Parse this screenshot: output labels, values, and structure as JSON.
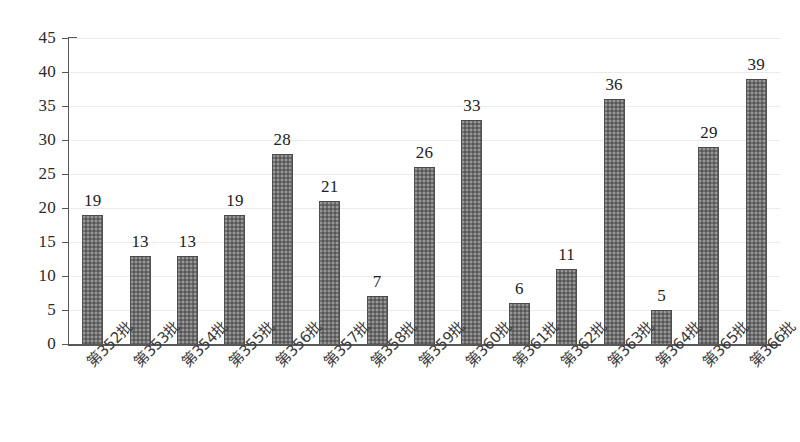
{
  "chart_data": {
    "type": "bar",
    "title": "",
    "subtitle": "",
    "xlabel": "",
    "ylabel": "",
    "ylim": [
      0,
      45
    ],
    "ytick_step": 5,
    "yticks": [
      45,
      40,
      35,
      30,
      25,
      20,
      15,
      10,
      5,
      0
    ],
    "grid": true,
    "legend": "none",
    "orientation": "vertical",
    "show_value_labels": true,
    "xtick_rotation": -45,
    "categories": [
      "第352批",
      "第353批",
      "第354批",
      "第355批",
      "第356批",
      "第357批",
      "第358批",
      "第359批",
      "第360批",
      "第361批",
      "第362批",
      "第363批",
      "第364批",
      "第365批",
      "第366批"
    ],
    "values": [
      19,
      13,
      13,
      19,
      28,
      21,
      7,
      26,
      33,
      6,
      11,
      36,
      5,
      29,
      39
    ],
    "colors": {
      "bar": "#6e6e6e",
      "bar_edge": "#4f4f4f",
      "axis": "#58585a",
      "grid": "#ebebeb",
      "text": "#222222",
      "background": "#ffffff"
    }
  }
}
